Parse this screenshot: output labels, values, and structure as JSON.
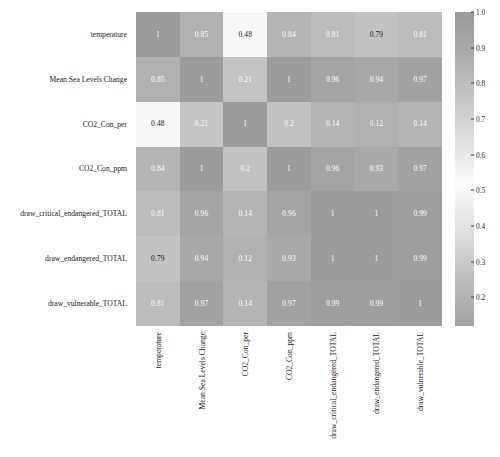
{
  "chart_data": {
    "type": "heatmap",
    "title": "",
    "xlabel": "",
    "ylabel": "",
    "categories": [
      "temperature",
      "Mean Sea Levels Change",
      "CO2_Con_per",
      "CO2_Con_ppm",
      "draw_critical_endangered_TOTAL",
      "draw_endangered_TOTAL",
      "draw_vulnerable_TOTAL"
    ],
    "x_categories": [
      "temperature",
      "Mean Sea Levels Change",
      "CO2_Con_per",
      "CO2_Con_ppm",
      "draw_critical_endangered_TOTAL",
      "draw_endangered_TOTAL",
      "draw_vulnerable_TOTAL"
    ],
    "y_categories": [
      "temperature",
      "Mean Sea Levels Change",
      "CO2_Con_per",
      "CO2_Con_ppm",
      "draw_critical_endangered_TOTAL",
      "draw_endangered_TOTAL",
      "draw_vulnerable_TOTAL"
    ],
    "values": [
      [
        1,
        0.85,
        0.48,
        0.84,
        0.81,
        0.79,
        0.81
      ],
      [
        0.85,
        1,
        0.21,
        1,
        0.96,
        0.94,
        0.97
      ],
      [
        0.48,
        0.21,
        1,
        0.2,
        0.14,
        0.12,
        0.14
      ],
      [
        0.84,
        1,
        0.2,
        1,
        0.96,
        0.93,
        0.97
      ],
      [
        0.81,
        0.96,
        0.14,
        0.96,
        1,
        1,
        0.99
      ],
      [
        0.79,
        0.94,
        0.12,
        0.93,
        1,
        1,
        0.99
      ],
      [
        0.81,
        0.97,
        0.14,
        0.97,
        0.99,
        0.99,
        1
      ]
    ],
    "cell_labels": [
      [
        "1",
        "0.85",
        "0.48",
        "0.84",
        "0.81",
        "0.79",
        "0.81"
      ],
      [
        "0.85",
        "1",
        "0.21",
        "1",
        "0.96",
        "0.94",
        "0.97"
      ],
      [
        "0.48",
        "0.21",
        "1",
        "0.2",
        "0.14",
        "0.12",
        "0.14"
      ],
      [
        "0.84",
        "1",
        "0.2",
        "1",
        "0.96",
        "0.93",
        "0.97"
      ],
      [
        "0.81",
        "0.96",
        "0.14",
        "0.96",
        "1",
        "1",
        "0.99"
      ],
      [
        "0.79",
        "0.94",
        "0.12",
        "0.93",
        "1",
        "1",
        "0.99"
      ],
      [
        "0.81",
        "0.97",
        "0.14",
        "0.97",
        "0.99",
        "0.99",
        "1"
      ]
    ],
    "grid": false,
    "legend_position": "right",
    "colorbar": {
      "ticks": [
        "1.0",
        "0.9",
        "0.8",
        "0.7",
        "0.6",
        "0.5",
        "0.4",
        "0.3",
        "0.2"
      ],
      "tick_values": [
        1.0,
        0.9,
        0.8,
        0.7,
        0.6,
        0.5,
        0.4,
        0.3,
        0.2
      ],
      "vmin": 0.12,
      "vmax": 1.0,
      "colormap": "grayscale-twilight",
      "color_stops": [
        {
          "value": 1.0,
          "color": "#9a9a9a"
        },
        {
          "value": 0.9,
          "color": "#a8a8a8"
        },
        {
          "value": 0.8,
          "color": "#bdbdbd"
        },
        {
          "value": 0.7,
          "color": "#d2d2d2"
        },
        {
          "value": 0.6,
          "color": "#e8e8e8"
        },
        {
          "value": 0.52,
          "color": "#fbfbfb"
        },
        {
          "value": 0.45,
          "color": "#ededed"
        },
        {
          "value": 0.35,
          "color": "#d8d8d8"
        },
        {
          "value": 0.25,
          "color": "#bdbdbd"
        },
        {
          "value": 0.2,
          "color": "#b2b2b2"
        },
        {
          "value": 0.12,
          "color": "#a3a3a3"
        }
      ]
    },
    "cell_colors": [
      [
        "#9c9c9c",
        "#b0b0b0",
        "#f7f7f7",
        "#b4b4b4",
        "#bcbcbc",
        "#c2c2c2",
        "#bcbcbc"
      ],
      [
        "#b0b0b0",
        "#9c9c9c",
        "#c4c4c4",
        "#9c9c9c",
        "#a4a4a4",
        "#a8a8a8",
        "#a2a2a2"
      ],
      [
        "#f7f7f7",
        "#c4c4c4",
        "#9c9c9c",
        "#c2c2c2",
        "#b4b4b4",
        "#b0b0b0",
        "#b4b4b4"
      ],
      [
        "#b4b4b4",
        "#9c9c9c",
        "#c2c2c2",
        "#9c9c9c",
        "#a4a4a4",
        "#a9a9a9",
        "#a2a2a2"
      ],
      [
        "#bcbcbc",
        "#a4a4a4",
        "#b4b4b4",
        "#a4a4a4",
        "#9c9c9c",
        "#9c9c9c",
        "#9e9e9e"
      ],
      [
        "#c2c2c2",
        "#a8a8a8",
        "#b0b0b0",
        "#a9a9a9",
        "#9c9c9c",
        "#9c9c9c",
        "#9e9e9e"
      ],
      [
        "#bcbcbc",
        "#a2a2a2",
        "#b4b4b4",
        "#a2a2a2",
        "#9e9e9e",
        "#9e9e9e",
        "#9c9c9c"
      ]
    ],
    "cell_text_colors": [
      [
        "#ffffff",
        "#ffffff",
        "#1a1a1a",
        "#ffffff",
        "#ffffff",
        "#1a1a1a",
        "#ffffff"
      ],
      [
        "#ffffff",
        "#ffffff",
        "#ffffff",
        "#ffffff",
        "#ffffff",
        "#ffffff",
        "#ffffff"
      ],
      [
        "#1a1a1a",
        "#ffffff",
        "#ffffff",
        "#ffffff",
        "#ffffff",
        "#ffffff",
        "#ffffff"
      ],
      [
        "#ffffff",
        "#ffffff",
        "#ffffff",
        "#ffffff",
        "#ffffff",
        "#ffffff",
        "#ffffff"
      ],
      [
        "#ffffff",
        "#ffffff",
        "#ffffff",
        "#ffffff",
        "#ffffff",
        "#ffffff",
        "#ffffff"
      ],
      [
        "#1a1a1a",
        "#ffffff",
        "#ffffff",
        "#ffffff",
        "#ffffff",
        "#ffffff",
        "#ffffff"
      ],
      [
        "#ffffff",
        "#ffffff",
        "#ffffff",
        "#ffffff",
        "#ffffff",
        "#ffffff",
        "#ffffff"
      ]
    ]
  }
}
